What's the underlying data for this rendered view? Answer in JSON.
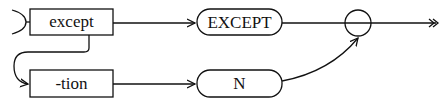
{
  "diagram": {
    "type": "railroad-syntax-diagram",
    "nodes": [
      {
        "id": "except",
        "label": "except",
        "shape": "rectangle"
      },
      {
        "id": "tion",
        "label": "-tion",
        "shape": "rectangle"
      },
      {
        "id": "EXCEPT",
        "label": "EXCEPT",
        "shape": "rounded"
      },
      {
        "id": "N",
        "label": "N",
        "shape": "rounded"
      },
      {
        "id": "junction",
        "label": "",
        "shape": "circle"
      }
    ],
    "edges": [
      {
        "from": "start",
        "to": "except"
      },
      {
        "from": "except",
        "to": "EXCEPT"
      },
      {
        "from": "except",
        "to": "tion"
      },
      {
        "from": "tion",
        "to": "N"
      },
      {
        "from": "EXCEPT",
        "to": "junction"
      },
      {
        "from": "N",
        "to": "junction"
      },
      {
        "from": "junction",
        "to": "end"
      }
    ]
  }
}
